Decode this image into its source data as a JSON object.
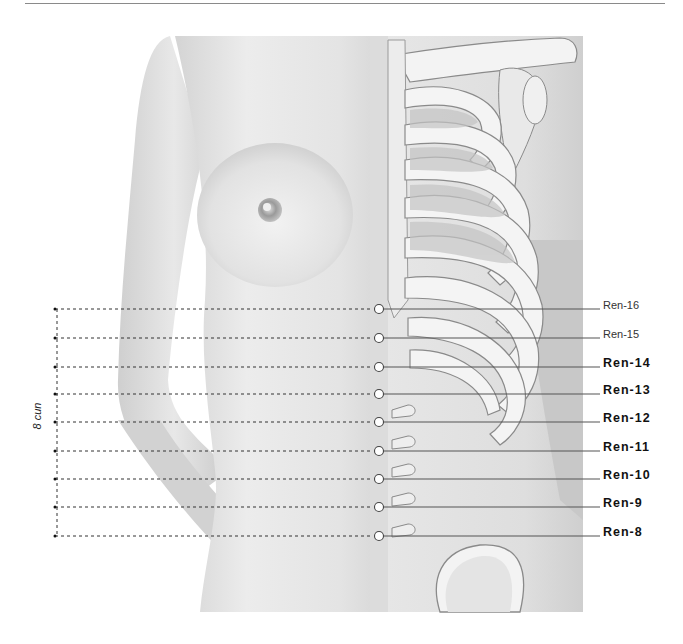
{
  "figure": {
    "title": "",
    "measure_label": "8 cun",
    "points": [
      {
        "label": "Ren-16",
        "y": 309,
        "weight": "light"
      },
      {
        "label": "Ren-15",
        "y": 338,
        "weight": "light"
      },
      {
        "label": "Ren-14",
        "y": 367,
        "weight": "bold"
      },
      {
        "label": "Ren-13",
        "y": 394,
        "weight": "bold"
      },
      {
        "label": "Ren-12",
        "y": 422,
        "weight": "bold"
      },
      {
        "label": "Ren-11",
        "y": 451,
        "weight": "bold"
      },
      {
        "label": "Ren-10",
        "y": 479,
        "weight": "bold"
      },
      {
        "label": "Ren-9",
        "y": 507,
        "weight": "bold"
      },
      {
        "label": "Ren-8",
        "y": 536,
        "weight": "bold"
      }
    ],
    "colors": {
      "skin_light": "#e9e9e9",
      "skin_mid": "#cfcfcf",
      "bone": "#f2f2f2",
      "bone_outline": "#8c8c8c",
      "leader_line": "#555555",
      "marker_fill": "#ffffff"
    }
  }
}
